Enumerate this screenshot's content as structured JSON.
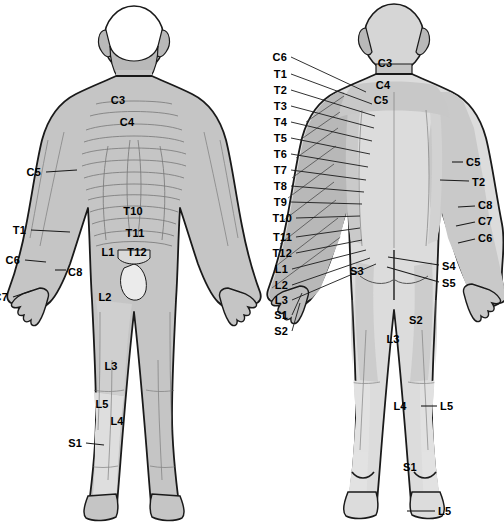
{
  "figure": {
    "views": [
      {
        "name": "anterior-view",
        "label": "front"
      },
      {
        "name": "posterior-view",
        "label": "back"
      }
    ],
    "colors": {
      "background": "#ffffff",
      "outline": "#1a1a1a",
      "body_mid_gray": "#c5c5c5",
      "body_light_gray": "#dcdcdc",
      "body_dark_gray": "#a8a8a8",
      "skin_white": "#f7f7f7",
      "leader_line": "#1a1a1a",
      "text": "#000000"
    }
  },
  "labels": {
    "front_figure": [
      {
        "text": "C3",
        "x": 118,
        "y": 100,
        "align": "c",
        "leader": false
      },
      {
        "text": "C4",
        "x": 127,
        "y": 122,
        "align": "c",
        "leader": false
      },
      {
        "text": "C5",
        "x": 41,
        "y": 172,
        "align": "r",
        "leader": true,
        "lx1": 46,
        "ly1": 172,
        "lx2": 77,
        "ly2": 170
      },
      {
        "text": "T1",
        "x": 26,
        "y": 230,
        "align": "r",
        "leader": true,
        "lx1": 31,
        "ly1": 230,
        "lx2": 70,
        "ly2": 232
      },
      {
        "text": "T10",
        "x": 133,
        "y": 211,
        "align": "c",
        "leader": false
      },
      {
        "text": "T11",
        "x": 135,
        "y": 233,
        "align": "c",
        "leader": false
      },
      {
        "text": "T12",
        "x": 137,
        "y": 252,
        "align": "c",
        "leader": false
      },
      {
        "text": "L1",
        "x": 108,
        "y": 252,
        "align": "c",
        "leader": false
      },
      {
        "text": "L2",
        "x": 105,
        "y": 297,
        "align": "c",
        "leader": false
      },
      {
        "text": "L3",
        "x": 111,
        "y": 366,
        "align": "c",
        "leader": false
      },
      {
        "text": "L5",
        "x": 102,
        "y": 404,
        "align": "c",
        "leader": false
      },
      {
        "text": "L4",
        "x": 117,
        "y": 421,
        "align": "c",
        "leader": false
      },
      {
        "text": "C6",
        "x": 20,
        "y": 260,
        "align": "r",
        "leader": true,
        "lx1": 25,
        "ly1": 260,
        "lx2": 46,
        "ly2": 262
      },
      {
        "text": "C8",
        "x": 68,
        "y": 272,
        "align": "l",
        "leader": true,
        "lx1": 55,
        "ly1": 270,
        "lx2": 66,
        "ly2": 270
      },
      {
        "text": "C7",
        "x": 8,
        "y": 297,
        "align": "r",
        "leader": true,
        "lx1": 13,
        "ly1": 297,
        "lx2": 31,
        "ly2": 291
      },
      {
        "text": "S1",
        "x": 82,
        "y": 443,
        "align": "r",
        "leader": true,
        "lx1": 86,
        "ly1": 443,
        "lx2": 104,
        "ly2": 445
      }
    ],
    "center_column": [
      {
        "text": "C6",
        "x": 265,
        "y": 57,
        "tx": 366,
        "ty": 92
      },
      {
        "text": "T1",
        "x": 265,
        "y": 74,
        "tx": 372,
        "ty": 104
      },
      {
        "text": "T2",
        "x": 265,
        "y": 90,
        "tx": 375,
        "ty": 116
      },
      {
        "text": "T3",
        "x": 265,
        "y": 106,
        "tx": 374,
        "ty": 128
      },
      {
        "text": "T4",
        "x": 265,
        "y": 122,
        "tx": 372,
        "ty": 141
      },
      {
        "text": "T5",
        "x": 265,
        "y": 138,
        "tx": 370,
        "ty": 154
      },
      {
        "text": "T6",
        "x": 265,
        "y": 154,
        "tx": 368,
        "ty": 167
      },
      {
        "text": "T7",
        "x": 265,
        "y": 170,
        "tx": 366,
        "ty": 180
      },
      {
        "text": "T8",
        "x": 265,
        "y": 186,
        "tx": 364,
        "ty": 192
      },
      {
        "text": "T9",
        "x": 265,
        "y": 202,
        "tx": 362,
        "ty": 204
      },
      {
        "text": "T10",
        "x": 270,
        "y": 218,
        "tx": 360,
        "ty": 216
      },
      {
        "text": "T11",
        "x": 270,
        "y": 237,
        "tx": 360,
        "ty": 228
      },
      {
        "text": "T12",
        "x": 270,
        "y": 253,
        "tx": 362,
        "ty": 240
      },
      {
        "text": "L1",
        "x": 266,
        "y": 269,
        "tx": 366,
        "ty": 250
      },
      {
        "text": "L2",
        "x": 266,
        "y": 285,
        "tx": 370,
        "ty": 258
      },
      {
        "text": "L3",
        "x": 266,
        "y": 300,
        "tx": 376,
        "ty": 264
      },
      {
        "text": "S1",
        "x": 266,
        "y": 315,
        "tx": 302,
        "ty": 293
      },
      {
        "text": "S2",
        "x": 266,
        "y": 331,
        "tx": 300,
        "ty": 303
      }
    ],
    "back_figure": [
      {
        "text": "C3",
        "x": 385,
        "y": 63,
        "align": "c",
        "leader": false
      },
      {
        "text": "C4",
        "x": 383,
        "y": 85,
        "align": "c",
        "leader": false
      },
      {
        "text": "C5",
        "x": 381,
        "y": 100,
        "align": "c",
        "leader": false
      },
      {
        "text": "C5",
        "x": 466,
        "y": 162,
        "align": "l",
        "leader": true,
        "lx1": 452,
        "ly1": 162,
        "lx2": 463,
        "ly2": 162
      },
      {
        "text": "T2",
        "x": 472,
        "y": 182,
        "align": "l",
        "leader": true,
        "lx1": 440,
        "ly1": 180,
        "lx2": 469,
        "ly2": 181
      },
      {
        "text": "T2b",
        "x": 0,
        "y": 0,
        "align": "c",
        "leader": false,
        "hidden": true
      },
      {
        "text": "C8",
        "x": 478,
        "y": 205,
        "align": "l",
        "leader": true,
        "lx1": 458,
        "ly1": 207,
        "lx2": 475,
        "ly2": 206
      },
      {
        "text": "C7",
        "x": 478,
        "y": 221,
        "align": "l",
        "leader": true,
        "lx1": 456,
        "ly1": 226,
        "lx2": 475,
        "ly2": 222
      },
      {
        "text": "C6",
        "x": 478,
        "y": 238,
        "align": "l",
        "leader": true,
        "lx1": 458,
        "ly1": 243,
        "lx2": 475,
        "ly2": 239
      },
      {
        "text": "S3",
        "x": 357,
        "y": 271,
        "align": "c",
        "leader": false
      },
      {
        "text": "S4",
        "x": 442,
        "y": 266,
        "align": "l",
        "leader": true,
        "lx1": 388,
        "ly1": 257,
        "lx2": 439,
        "ly2": 265
      },
      {
        "text": "S5",
        "x": 442,
        "y": 283,
        "align": "l",
        "leader": true,
        "lx1": 387,
        "ly1": 267,
        "lx2": 439,
        "ly2": 282
      },
      {
        "text": "S2",
        "x": 416,
        "y": 320,
        "align": "c",
        "leader": false
      },
      {
        "text": "L3",
        "x": 393,
        "y": 339,
        "align": "c",
        "leader": false
      },
      {
        "text": "L4",
        "x": 400,
        "y": 406,
        "align": "c",
        "leader": false
      },
      {
        "text": "L5",
        "x": 440,
        "y": 406,
        "align": "l",
        "leader": true,
        "lx1": 421,
        "ly1": 406,
        "lx2": 437,
        "ly2": 406
      },
      {
        "text": "S1",
        "x": 410,
        "y": 467,
        "align": "c",
        "leader": false
      },
      {
        "text": "L5",
        "x": 438,
        "y": 511,
        "align": "l",
        "leader": true,
        "lx1": 407,
        "ly1": 511,
        "lx2": 435,
        "ly2": 511
      }
    ]
  }
}
